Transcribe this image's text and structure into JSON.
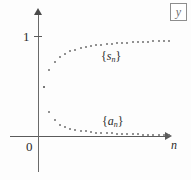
{
  "figure": {
    "background_color": "#fdfdfd",
    "axis_color": "#5a5a5a",
    "dot_color": "#6e6e6e"
  },
  "corner_marker": {
    "label": "y",
    "name": "boxed-y-marker"
  },
  "axis_labels": {
    "y_tick_one": "1",
    "origin": "0",
    "x_axis": "n"
  },
  "series_labels": {
    "partial_sums": {
      "open": "{",
      "var": "s",
      "sub": "n",
      "close": "}"
    },
    "terms": {
      "open": "{",
      "var": "a",
      "sub": "n",
      "close": "}"
    }
  },
  "chart_data": {
    "type": "scatter",
    "title": "",
    "xlabel": "n",
    "ylabel": "y",
    "grid": false,
    "legend": "inline-annotations",
    "xlim": [
      0,
      26
    ],
    "ylim": [
      0,
      1.18
    ],
    "y_ticks": [
      1
    ],
    "x_ticks": [
      0
    ],
    "annotations": [
      {
        "text": "{s_n}",
        "x": 12.2,
        "y": 0.83
      },
      {
        "text": "{a_n}",
        "x": 12.4,
        "y": 0.19
      }
    ],
    "series": [
      {
        "name": "{s_n}",
        "description": "partial sums increasing toward 1",
        "x": [
          1,
          2,
          3,
          4,
          5,
          6,
          7,
          8,
          9,
          10,
          11,
          12,
          13,
          14,
          15,
          16,
          17,
          18,
          19,
          20,
          21,
          22,
          23,
          24,
          25
        ],
        "y": [
          0.5,
          0.67,
          0.75,
          0.8,
          0.833,
          0.857,
          0.875,
          0.889,
          0.9,
          0.909,
          0.917,
          0.923,
          0.929,
          0.933,
          0.938,
          0.941,
          0.944,
          0.947,
          0.95,
          0.952,
          0.955,
          0.957,
          0.958,
          0.96,
          0.962
        ]
      },
      {
        "name": "{a_n}",
        "description": "terms decreasing toward 0",
        "x": [
          1,
          2,
          3,
          4,
          5,
          6,
          7,
          8,
          9,
          10,
          11,
          12,
          13,
          14,
          15,
          16,
          17,
          18,
          19,
          20,
          21,
          22,
          23,
          24,
          25
        ],
        "y": [
          0.5,
          0.25,
          0.167,
          0.125,
          0.1,
          0.083,
          0.071,
          0.063,
          0.056,
          0.05,
          0.045,
          0.042,
          0.038,
          0.036,
          0.033,
          0.031,
          0.029,
          0.028,
          0.026,
          0.025,
          0.024,
          0.023,
          0.022,
          0.021,
          0.02
        ]
      }
    ],
    "shared_first_point": {
      "x": 1,
      "y": 0.5,
      "note": "s_1 = a_1"
    }
  },
  "plot_geometry": {
    "origin_px": {
      "x": 38,
      "y": 136
    },
    "x_scale_px_per_unit": 5.2,
    "y_value_one_px": 36
  }
}
